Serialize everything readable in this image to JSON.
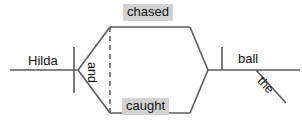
{
  "diagram": {
    "type": "sentence-diagram",
    "sentence": "Hilda chased and caught the ball",
    "canvas": {
      "width": 302,
      "height": 129,
      "background": "#ffffff"
    },
    "colors": {
      "line": "#5a5a5a",
      "text": "#121212",
      "highlight": "#d2d2d2",
      "background": "#ffffff"
    },
    "labels": {
      "subject": "Hilda",
      "verb_1": "chased",
      "verb_2": "caught",
      "conjunction": "and",
      "object": "ball",
      "article": "the"
    },
    "highlighted": [
      "chased",
      "caught"
    ],
    "lines": {
      "baseline_left": {
        "x1": 10,
        "y1": 70,
        "x2": 77,
        "y2": 70
      },
      "baseline_right": {
        "x1": 209,
        "y1": 70,
        "x2": 300,
        "y2": 70
      },
      "subject_verb_divider": {
        "x": 74,
        "y1": 47,
        "y2": 93
      },
      "verb_object_tick": {
        "x": 222,
        "y1": 47,
        "y2": 70
      },
      "article_modifier": {
        "x1": 256,
        "y1": 70,
        "x2": 285,
        "y2": 102
      },
      "split_upper_left": {
        "x1": 77,
        "y1": 70,
        "x2": 110,
        "y2": 27
      },
      "split_lower_left": {
        "x1": 77,
        "y1": 70,
        "x2": 110,
        "y2": 113
      },
      "split_upper_right": {
        "x1": 190,
        "y1": 27,
        "x2": 209,
        "y2": 70
      },
      "split_lower_right": {
        "x1": 190,
        "y1": 113,
        "x2": 209,
        "y2": 70
      },
      "verb_1_baseline": {
        "x1": 110,
        "y1": 27,
        "x2": 190,
        "y2": 27
      },
      "verb_2_baseline": {
        "x1": 110,
        "y1": 113,
        "x2": 190,
        "y2": 113
      },
      "conjunction_dashed": {
        "x": 110,
        "y1": 27,
        "y2": 113,
        "dash": "4 4"
      }
    }
  }
}
